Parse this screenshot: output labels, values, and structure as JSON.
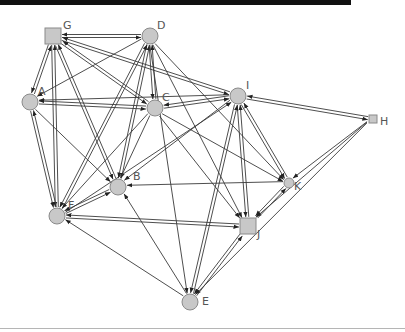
{
  "diagram": {
    "type": "directed-graph",
    "colors": {
      "node_fill": "#c8c8c8",
      "node_stroke": "#8a8a8a",
      "edge": "#3a3a3a",
      "label": "#555555",
      "topbar": "#111111"
    },
    "nodes": [
      {
        "id": "A",
        "label": "A",
        "shape": "circle",
        "x": 30,
        "y": 102,
        "r": 8,
        "lx": 38,
        "ly": 95
      },
      {
        "id": "B",
        "label": "B",
        "shape": "circle",
        "x": 118,
        "y": 187,
        "r": 8,
        "lx": 133,
        "ly": 180
      },
      {
        "id": "C",
        "label": "C",
        "shape": "circle",
        "x": 155,
        "y": 108,
        "r": 8,
        "lx": 162,
        "ly": 101
      },
      {
        "id": "D",
        "label": "D",
        "shape": "circle",
        "x": 150,
        "y": 36,
        "r": 8,
        "lx": 157,
        "ly": 29
      },
      {
        "id": "E",
        "label": "E",
        "shape": "circle",
        "x": 190,
        "y": 302,
        "r": 8,
        "lx": 202,
        "ly": 305
      },
      {
        "id": "F",
        "label": "F",
        "shape": "circle",
        "x": 57,
        "y": 216,
        "r": 8,
        "lx": 68,
        "ly": 209
      },
      {
        "id": "G",
        "label": "G",
        "shape": "square",
        "x": 53,
        "y": 36,
        "r": 8,
        "lx": 63,
        "ly": 29
      },
      {
        "id": "H",
        "label": "H",
        "shape": "square",
        "x": 373,
        "y": 119,
        "r": 4,
        "lx": 380,
        "ly": 125
      },
      {
        "id": "I",
        "label": "I",
        "shape": "circle",
        "x": 238,
        "y": 96,
        "r": 8,
        "lx": 246,
        "ly": 89
      },
      {
        "id": "J",
        "label": "J",
        "shape": "square",
        "x": 248,
        "y": 226,
        "r": 8,
        "lx": 257,
        "ly": 238
      },
      {
        "id": "K",
        "label": "K",
        "shape": "circle",
        "x": 289,
        "y": 183,
        "r": 5,
        "lx": 294,
        "ly": 190
      }
    ],
    "edges": [
      [
        "G",
        "D"
      ],
      [
        "D",
        "G"
      ],
      [
        "G",
        "A"
      ],
      [
        "A",
        "G"
      ],
      [
        "G",
        "F"
      ],
      [
        "F",
        "G"
      ],
      [
        "G",
        "B"
      ],
      [
        "B",
        "G"
      ],
      [
        "G",
        "I"
      ],
      [
        "I",
        "G"
      ],
      [
        "G",
        "C"
      ],
      [
        "C",
        "G"
      ],
      [
        "D",
        "A"
      ],
      [
        "D",
        "B"
      ],
      [
        "B",
        "D"
      ],
      [
        "D",
        "F"
      ],
      [
        "F",
        "D"
      ],
      [
        "D",
        "C"
      ],
      [
        "C",
        "D"
      ],
      [
        "D",
        "K"
      ],
      [
        "D",
        "J"
      ],
      [
        "D",
        "E"
      ],
      [
        "A",
        "C"
      ],
      [
        "C",
        "A"
      ],
      [
        "A",
        "F"
      ],
      [
        "F",
        "A"
      ],
      [
        "A",
        "B"
      ],
      [
        "I",
        "A"
      ],
      [
        "C",
        "I"
      ],
      [
        "I",
        "C"
      ],
      [
        "C",
        "B"
      ],
      [
        "C",
        "F"
      ],
      [
        "C",
        "K"
      ],
      [
        "C",
        "J"
      ],
      [
        "I",
        "H"
      ],
      [
        "H",
        "I"
      ],
      [
        "I",
        "K"
      ],
      [
        "K",
        "I"
      ],
      [
        "I",
        "J"
      ],
      [
        "J",
        "I"
      ],
      [
        "I",
        "E"
      ],
      [
        "E",
        "I"
      ],
      [
        "I",
        "B"
      ],
      [
        "F",
        "I"
      ],
      [
        "H",
        "K"
      ],
      [
        "H",
        "J"
      ],
      [
        "H",
        "E"
      ],
      [
        "K",
        "B"
      ],
      [
        "J",
        "K"
      ],
      [
        "K",
        "J"
      ],
      [
        "F",
        "B"
      ],
      [
        "B",
        "F"
      ],
      [
        "J",
        "F"
      ],
      [
        "F",
        "J"
      ],
      [
        "E",
        "F"
      ],
      [
        "E",
        "B"
      ],
      [
        "J",
        "E"
      ],
      [
        "E",
        "J"
      ]
    ]
  }
}
